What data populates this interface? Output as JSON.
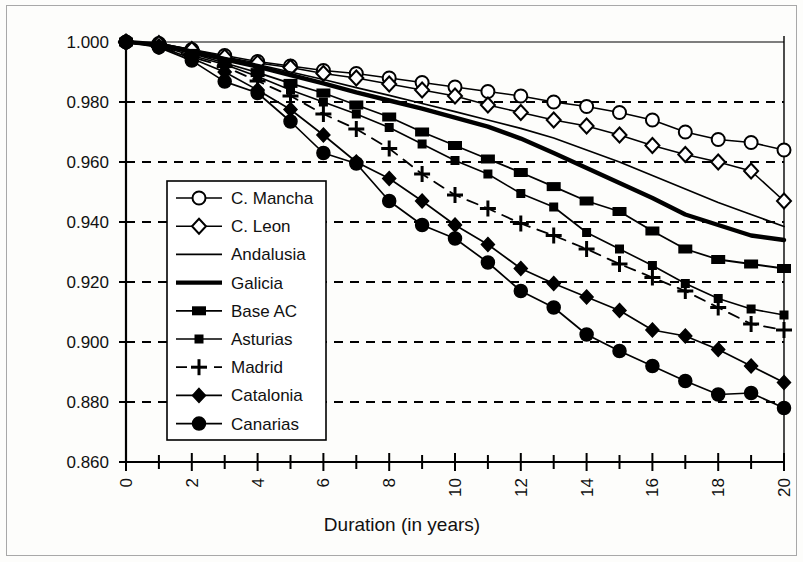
{
  "chart_data": {
    "type": "line",
    "title": "",
    "xlabel": "Duration (in years)",
    "ylabel": "",
    "xlim": [
      0,
      20
    ],
    "ylim": [
      0.86,
      1.0
    ],
    "grid": true,
    "legend_position": "center-left-inside",
    "x": [
      0,
      1,
      2,
      3,
      4,
      5,
      6,
      7,
      8,
      9,
      10,
      11,
      12,
      13,
      14,
      15,
      16,
      17,
      18,
      19,
      20
    ],
    "x_tick_labels": [
      "0",
      "2",
      "4",
      "6",
      "8",
      "10",
      "12",
      "14",
      "16",
      "18",
      "20"
    ],
    "x_tick_values": [
      0,
      2,
      4,
      6,
      8,
      10,
      12,
      14,
      16,
      18,
      20
    ],
    "y_tick_labels": [
      "0.860",
      "0.880",
      "0.900",
      "0.920",
      "0.940",
      "0.960",
      "0.980",
      "1.000"
    ],
    "y_tick_values": [
      0.86,
      0.88,
      0.9,
      0.92,
      0.94,
      0.96,
      0.98,
      1.0
    ],
    "series": [
      {
        "name": "C. Mancha",
        "marker": "open-circle",
        "line_style": "solid",
        "line_width": 1.6,
        "values": [
          1.0,
          0.9995,
          0.9975,
          0.9955,
          0.9935,
          0.992,
          0.9905,
          0.9895,
          0.988,
          0.9865,
          0.985,
          0.9835,
          0.982,
          0.98,
          0.9785,
          0.9765,
          0.974,
          0.97,
          0.9675,
          0.9665,
          0.964
        ]
      },
      {
        "name": "C. Leon",
        "marker": "open-diamond",
        "line_style": "solid",
        "line_width": 1.6,
        "values": [
          1.0,
          0.9995,
          0.9975,
          0.995,
          0.993,
          0.9915,
          0.9895,
          0.988,
          0.986,
          0.984,
          0.982,
          0.979,
          0.9765,
          0.974,
          0.972,
          0.969,
          0.9655,
          0.9625,
          0.96,
          0.957,
          0.947
        ]
      },
      {
        "name": "Andalusia",
        "marker": "none",
        "line_style": "solid",
        "line_width": 1.7,
        "values": [
          1.0,
          0.9992,
          0.9972,
          0.9948,
          0.9925,
          0.99,
          0.9875,
          0.9848,
          0.9822,
          0.9795,
          0.9768,
          0.974,
          0.9712,
          0.968,
          0.964,
          0.96,
          0.9555,
          0.951,
          0.9465,
          0.9425,
          0.9385
        ]
      },
      {
        "name": "Galicia",
        "marker": "none",
        "line_style": "solid",
        "line_width": 4.4,
        "values": [
          1.0,
          0.9992,
          0.9968,
          0.9942,
          0.9918,
          0.989,
          0.9862,
          0.9832,
          0.9805,
          0.9778,
          0.9748,
          0.9718,
          0.9678,
          0.963,
          0.958,
          0.953,
          0.948,
          0.9425,
          0.939,
          0.9355,
          0.934
        ]
      },
      {
        "name": "Base AC",
        "marker": "filled-wide-square",
        "line_style": "solid",
        "line_width": 1.8,
        "values": [
          1.0,
          0.999,
          0.9962,
          0.993,
          0.9898,
          0.9862,
          0.983,
          0.979,
          0.975,
          0.97,
          0.9655,
          0.961,
          0.9565,
          0.9518,
          0.947,
          0.9435,
          0.937,
          0.931,
          0.9275,
          0.926,
          0.9245
        ]
      },
      {
        "name": "Asturias",
        "marker": "filled-small-square",
        "line_style": "solid",
        "line_width": 1.6,
        "values": [
          1.0,
          0.9988,
          0.9955,
          0.9925,
          0.9885,
          0.984,
          0.98,
          0.976,
          0.9715,
          0.966,
          0.9605,
          0.956,
          0.9495,
          0.945,
          0.9365,
          0.931,
          0.9255,
          0.9195,
          0.9145,
          0.911,
          0.909
        ]
      },
      {
        "name": "Madrid",
        "marker": "plus",
        "line_style": "dashed",
        "line_width": 1.8,
        "values": [
          1.0,
          0.9985,
          0.995,
          0.9918,
          0.987,
          0.982,
          0.976,
          0.971,
          0.9645,
          0.956,
          0.949,
          0.9445,
          0.9395,
          0.9355,
          0.931,
          0.926,
          0.9215,
          0.917,
          0.9115,
          0.906,
          0.904
        ]
      },
      {
        "name": "Catalonia",
        "marker": "filled-diamond",
        "line_style": "solid",
        "line_width": 1.7,
        "values": [
          1.0,
          0.9985,
          0.9945,
          0.99,
          0.984,
          0.9775,
          0.969,
          0.96,
          0.9545,
          0.947,
          0.939,
          0.9325,
          0.9245,
          0.9195,
          0.915,
          0.9105,
          0.904,
          0.902,
          0.8975,
          0.892,
          0.8865
        ]
      },
      {
        "name": "Canarias",
        "marker": "filled-circle",
        "line_style": "solid",
        "line_width": 1.7,
        "values": [
          1.0,
          0.9982,
          0.9938,
          0.9868,
          0.983,
          0.9735,
          0.963,
          0.9595,
          0.947,
          0.939,
          0.9345,
          0.9265,
          0.917,
          0.9115,
          0.9025,
          0.897,
          0.892,
          0.887,
          0.8825,
          0.883,
          0.878
        ]
      }
    ]
  },
  "legend": {
    "items": [
      {
        "label": "C. Mancha"
      },
      {
        "label": "C. Leon"
      },
      {
        "label": "Andalusia"
      },
      {
        "label": "Galicia"
      },
      {
        "label": "Base AC"
      },
      {
        "label": "Asturias"
      },
      {
        "label": "Madrid"
      },
      {
        "label": "Catalonia"
      },
      {
        "label": "Canarias"
      }
    ]
  }
}
